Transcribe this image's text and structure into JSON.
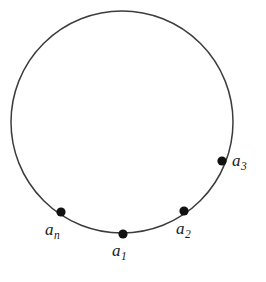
{
  "figure": {
    "type": "geometric-diagram",
    "background_color": "#ffffff",
    "circle": {
      "stroke_color": "#3c3c3c",
      "stroke_width": 1.5,
      "fill": "none",
      "center_x": 122,
      "center_y": 122,
      "radius": 111
    },
    "point_style": {
      "fill_color": "#111111",
      "radius": 4.6
    },
    "points": [
      {
        "id": "a1",
        "label_base": "a",
        "label_sub": "1",
        "x": 123,
        "y": 234,
        "label_x": 112,
        "label_y": 242
      },
      {
        "id": "a2",
        "label_base": "a",
        "label_sub": "2",
        "x": 184,
        "y": 211,
        "label_x": 176,
        "label_y": 220
      },
      {
        "id": "a3",
        "label_base": "a",
        "label_sub": "3",
        "x": 222,
        "y": 161,
        "label_x": 232,
        "label_y": 152
      },
      {
        "id": "an",
        "label_base": "a",
        "label_sub": "n",
        "x": 61,
        "y": 212,
        "label_x": 45,
        "label_y": 221
      }
    ]
  }
}
